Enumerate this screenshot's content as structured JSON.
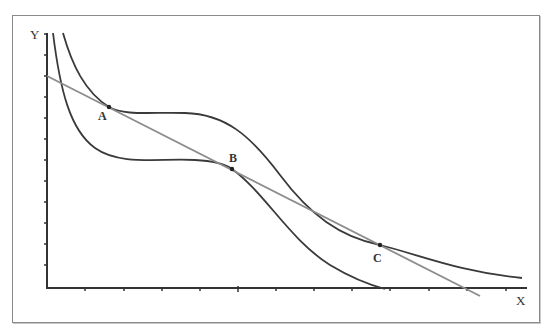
{
  "diagram": {
    "axes": {
      "x_label": "X",
      "y_label": "Y"
    },
    "points": [
      {
        "label": "A",
        "x": 109,
        "y": 107
      },
      {
        "label": "B",
        "x": 232,
        "y": 169
      },
      {
        "label": "C",
        "x": 380,
        "y": 245
      }
    ],
    "colors": {
      "curve": "#3a3a3a",
      "line": "#8c8c8c",
      "axis": "#333333",
      "frame": "#8a8a8a"
    }
  }
}
